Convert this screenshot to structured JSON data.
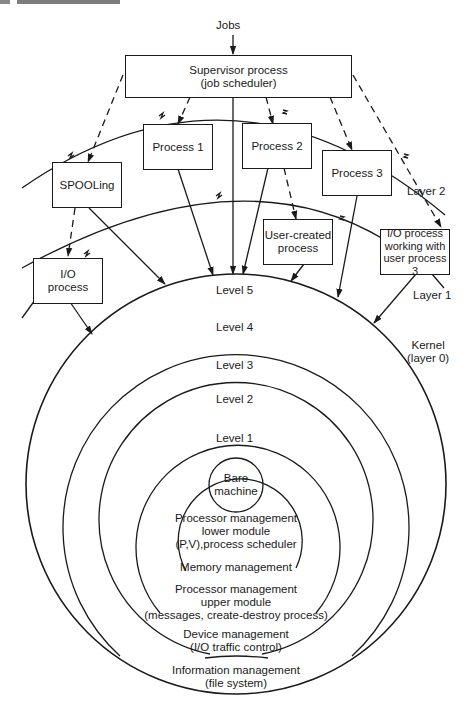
{
  "input": {
    "label": "Jobs"
  },
  "supervisor": {
    "line1": "Supervisor process",
    "line2": "(job scheduler)"
  },
  "processes": [
    {
      "id": "spooling",
      "lines": [
        "SPOOLing"
      ]
    },
    {
      "id": "process-1",
      "lines": [
        "Process 1"
      ]
    },
    {
      "id": "process-2",
      "lines": [
        "Process 2"
      ]
    },
    {
      "id": "process-3",
      "lines": [
        "Process 3"
      ]
    },
    {
      "id": "io-process",
      "lines": [
        "I/O",
        "process"
      ]
    },
    {
      "id": "user-created",
      "lines": [
        "User-created",
        "process"
      ]
    },
    {
      "id": "io-user3",
      "lines": [
        "I/O process",
        "working with",
        "user process 3"
      ]
    }
  ],
  "layers": {
    "layer2": "Layer 2",
    "layer1": "Layer 1",
    "kernel": {
      "line1": "Kernel",
      "line2": "(layer 0)"
    }
  },
  "levels": {
    "level5": "Level 5",
    "level4": "Level 4",
    "level3": "Level 3",
    "level2": "Level 2",
    "level1": "Level 1"
  },
  "core": {
    "line1": "Bare",
    "line2": "machine"
  },
  "modules": {
    "level1": [
      "Processor management",
      "lower module",
      "(P,V),process scheduler"
    ],
    "level2": [
      "Memory management"
    ],
    "level3": [
      "Processor management",
      "upper module",
      "(messages, create-destroy process)"
    ],
    "level4": [
      "Device management",
      "(I/O traffic control)"
    ],
    "level5": [
      "Information management",
      "(file system)"
    ]
  },
  "colors": {
    "ink": "#1a1a1a",
    "paper": "#ffffff"
  }
}
